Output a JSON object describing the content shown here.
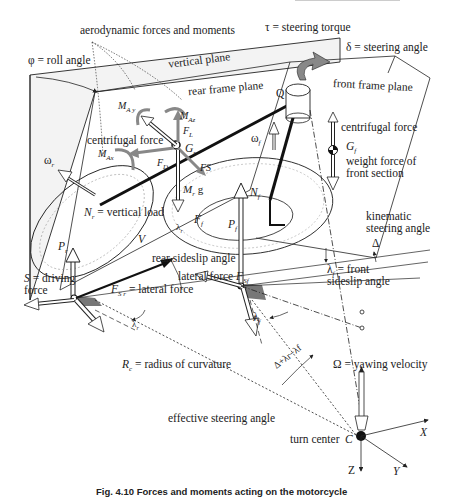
{
  "figure": {
    "caption": "Fig. 4.10 Forces and moments acting on the motorcycle"
  },
  "labels": {
    "aero": "aerodynamic forces and moments",
    "roll_angle": "φ = roll angle",
    "vertical_plane": "vertical plane",
    "rear_frame_plane": "rear frame plane",
    "steering_torque": "τ = steering torque",
    "steering_angle": "δ = steering angle",
    "front_frame_plane": "front frame plane",
    "Q": "Q",
    "MAy": "M",
    "MAy_sub": "A y",
    "MAz": "M",
    "MAz_sub": "Az",
    "MAx": "M",
    "MAx_sub": "Ax",
    "FL": "F",
    "FL_sub": "L",
    "Gr": "G",
    "Gr_sub": "r",
    "FD": "F",
    "FD_sub": "D",
    "FS": "FS",
    "Mrg": "M",
    "Mrg_sub": "r",
    "Mrg_g": " g",
    "centrifugal_rear": "centrifugal force",
    "omega_r": "ω",
    "omega_r_sub": "r",
    "omega_f": "ω",
    "omega_f_sub": "f",
    "Nr": "N",
    "Nr_sub": "r",
    "Nr_text": " = vertical load",
    "Nf": "N",
    "Nf_sub": "f",
    "Pr": "P",
    "Pr_sub": "r",
    "Pf": "P",
    "Pf_sub": "f",
    "Ff": "F",
    "Ff_sub": "f",
    "V": "V",
    "lambda_r": "λ",
    "lambda_r_sub": "r",
    "rear_sideslip": "rear sideslip angle",
    "lateral_force_front": "lateral force ",
    "Fsf": "F",
    "Fsf_sub": "Sf",
    "S": "S",
    "driving1": " = driving",
    "driving2": "force",
    "Fsr": "F",
    "Fsr_sub": "S r",
    "Fsr_text": " = lateral force",
    "lambda_r2": "λ",
    "lambda_r2_sub": "r",
    "centrifugal_front": "centrifugal force",
    "Gf": "G",
    "Gf_sub": "f",
    "weight_front1": "weight force of",
    "weight_front2": "front section",
    "kinematic1": "kinematic",
    "kinematic2": "steering angle",
    "Delta": "Δ",
    "lambda_f": "λ",
    "lambda_f_sub": "f",
    "front_sideslip1": " = front",
    "front_sideslip2": "sideslip angle",
    "lambda_f2": "λ",
    "lambda_f2_sub": "f",
    "Rc": "R",
    "Rc_sub": "c",
    "Rc_text": " = radius of curvature",
    "effective_angle_expr": "Δ+λr−λf",
    "yawing": "Ω = yawing velocity",
    "effective_steering": "effective steering angle",
    "turn_center": "turn center",
    "C": "C",
    "X": "X",
    "Y": "Y",
    "Z": "Z"
  },
  "colors": {
    "line": "#1a1a1a",
    "plane_fill": "#f2f2f2",
    "gray_arrow": "#8a8a8a",
    "shadow": "#7a7a7a"
  }
}
